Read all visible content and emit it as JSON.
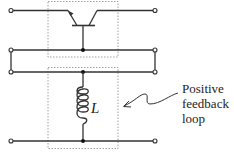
{
  "diagram": {
    "type": "circuit-schematic",
    "components": [
      {
        "id": "transistor",
        "kind": "bipolar-transistor",
        "position": "top block"
      },
      {
        "id": "inductor",
        "kind": "inductor",
        "label": "L",
        "position": "bottom block"
      }
    ],
    "inductor_label": "L",
    "annotation": {
      "lines": [
        "Positive",
        "feedback",
        "loop"
      ]
    },
    "terminals_count": 6,
    "colors": {
      "line": "#333333",
      "dashed_box": "#888888",
      "background": "#ffffff"
    }
  }
}
